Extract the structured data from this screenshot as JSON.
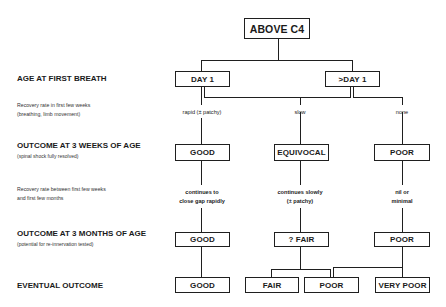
{
  "diagram": {
    "root": {
      "label": "ABOVE C4"
    },
    "rows": [
      {
        "id": "age_first_breath",
        "label": "AGE AT FIRST BREATH",
        "sub": ""
      },
      {
        "id": "recovery_first_weeks",
        "desc_lines": [
          "Recovery rate in first few weeks",
          "(breathing, limb movement)"
        ]
      },
      {
        "id": "outcome_3_weeks",
        "label": "OUTCOME AT 3 WEEKS OF AGE",
        "sub": "(spinal shock fully resolved)"
      },
      {
        "id": "recovery_weeks_months",
        "desc_lines": [
          "Recovery rate between first few weeks",
          "and first few months"
        ]
      },
      {
        "id": "outcome_3_months",
        "label": "OUTCOME AT 3 MONTHS OF AGE",
        "sub": "(potential for re-innervation tested)"
      },
      {
        "id": "eventual_outcome",
        "label": "EVENTUAL OUTCOME",
        "sub": ""
      }
    ],
    "age_boxes": [
      {
        "label": "DAY 1"
      },
      {
        "label": ">DAY 1"
      }
    ],
    "recovery_rates_weeks": [
      {
        "text": "rapid (± patchy)"
      },
      {
        "text": "slow"
      },
      {
        "text": "none"
      }
    ],
    "outcome_3_weeks_boxes": [
      {
        "label": "GOOD"
      },
      {
        "label": "EQUIVOCAL"
      },
      {
        "label": "POOR"
      }
    ],
    "recovery_rates_months": [
      {
        "lines": [
          "continues to",
          "close gap rapidly"
        ]
      },
      {
        "lines": [
          "continues slowly",
          "(± patchy)"
        ]
      },
      {
        "lines": [
          "nil or",
          "minimal"
        ]
      }
    ],
    "outcome_3_months_boxes": [
      {
        "label": "GOOD"
      },
      {
        "label": "? FAIR"
      },
      {
        "label": "POOR"
      }
    ],
    "eventual_boxes": [
      {
        "label": "GOOD"
      },
      {
        "label": "FAIR"
      },
      {
        "label": "POOR"
      },
      {
        "label": "VERY POOR"
      }
    ],
    "colors": {
      "line": "#1f1f1f",
      "text": "#1a1a1a",
      "background": "#ffffff"
    }
  }
}
